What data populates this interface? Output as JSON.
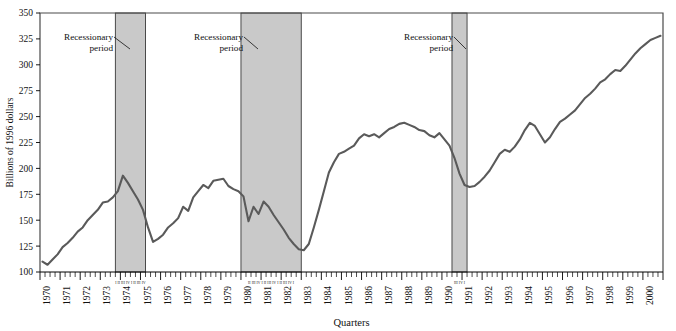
{
  "chart_data": {
    "type": "line",
    "title": "",
    "xlabel": "Quarters",
    "ylabel": "Billions of 1996 dollars",
    "ylim": [
      100,
      350
    ],
    "yticks": [
      100,
      125,
      150,
      175,
      200,
      225,
      250,
      275,
      300,
      325,
      350
    ],
    "ytick_labels": [
      "100",
      "125",
      "150",
      "175",
      "200",
      "225",
      "250",
      "275",
      "300",
      "325",
      "350"
    ],
    "grid": false,
    "legend": "none",
    "x_start_year": 1970,
    "x_end_year": 2000,
    "x_tick_labels": [
      "1970",
      "1971",
      "1972",
      "1973",
      "1974",
      "1975",
      "1976",
      "1977",
      "1978",
      "1979",
      "1980",
      "1981",
      "1982",
      "1983",
      "1984",
      "1985",
      "1986",
      "1987",
      "1988",
      "1989",
      "1990",
      "1991",
      "1992",
      "1993",
      "1994",
      "1995",
      "1996",
      "1997",
      "1998",
      "1999",
      "2000"
    ],
    "quarters_per_year": 4,
    "series": [
      {
        "name": "Real investment",
        "color": "#5a5a5a",
        "values": [
          110,
          107,
          112,
          117,
          124,
          128,
          133,
          139,
          143,
          150,
          155,
          160,
          167,
          168,
          172,
          178,
          193,
          186,
          178,
          170,
          160,
          143,
          129,
          132,
          136,
          143,
          147,
          152,
          163,
          159,
          172,
          178,
          184,
          181,
          188,
          189,
          190,
          183,
          180,
          178,
          173,
          149,
          163,
          156,
          168,
          163,
          155,
          148,
          141,
          133,
          127,
          122,
          121,
          127,
          143,
          160,
          178,
          196,
          206,
          214,
          216,
          219,
          222,
          229,
          233,
          231,
          233,
          230,
          234,
          238,
          240,
          243,
          244,
          242,
          240,
          237,
          236,
          232,
          230,
          234,
          228,
          222,
          210,
          195,
          184,
          182,
          183,
          187,
          192,
          198,
          206,
          214,
          218,
          216,
          221,
          228,
          237,
          244,
          241,
          233,
          225,
          230,
          238,
          245,
          248,
          252,
          256,
          262,
          268,
          272,
          277,
          283,
          286,
          291,
          295,
          294,
          299,
          305,
          311,
          316,
          320,
          324,
          326,
          328
        ]
      }
    ],
    "recession_bands": [
      {
        "label": "Recessionary period",
        "start_year": 1973,
        "start_quarter": 4,
        "end_year": 1975,
        "end_quarter": 1,
        "quarter_ticks": "I II III IV I II III IV"
      },
      {
        "label": "Recessionary period",
        "start_year": 1980,
        "start_quarter": 1,
        "end_year": 1982,
        "end_quarter": 4,
        "quarter_ticks": "II III IV I II III IV I II III IV I"
      },
      {
        "label": "Recessionary period",
        "start_year": 1990,
        "start_quarter": 3,
        "end_year": 1991,
        "end_quarter": 1,
        "quarter_ticks": "III IV I"
      }
    ],
    "colors": {
      "line": "#5a5a5a",
      "band_fill": "#c9c9c9",
      "band_stroke": "#3a3a3a",
      "axis": "#000000",
      "background": "#ffffff"
    },
    "annotations": [
      {
        "text_line1": "Recessionary",
        "text_line2": "period",
        "target_band": 0
      },
      {
        "text_line1": "Recessionary",
        "text_line2": "period",
        "target_band": 1
      },
      {
        "text_line1": "Recessionary",
        "text_line2": "period",
        "target_band": 2
      }
    ]
  }
}
